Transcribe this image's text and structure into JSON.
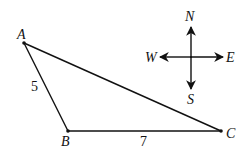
{
  "diagram": {
    "vertices": [
      {
        "name": "A",
        "x": 24,
        "y": 43
      },
      {
        "name": "B",
        "x": 68,
        "y": 131
      },
      {
        "name": "C",
        "x": 221,
        "y": 131
      }
    ],
    "side_labels": {
      "AB": "5",
      "BC": "7"
    },
    "compass": {
      "north": "N",
      "south": "S",
      "west": "W",
      "east": "E"
    },
    "colors": {
      "stroke": "#111111",
      "background": "#ffffff"
    }
  }
}
